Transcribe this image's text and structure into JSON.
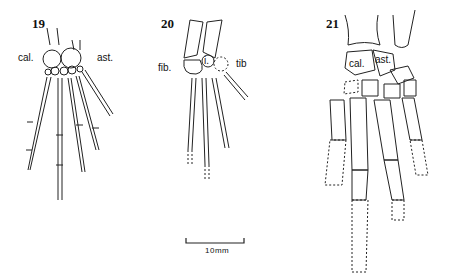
{
  "figure": {
    "panels": [
      {
        "number": "19",
        "labels": {
          "left": "cal.",
          "right": "ast."
        }
      },
      {
        "number": "20",
        "labels": {
          "left": "fib.",
          "center": "i.",
          "right": "tib"
        }
      },
      {
        "number": "21",
        "labels": {
          "left": "cal.",
          "right": "ast."
        }
      }
    ],
    "scale_bar": {
      "label": "10mm"
    }
  }
}
